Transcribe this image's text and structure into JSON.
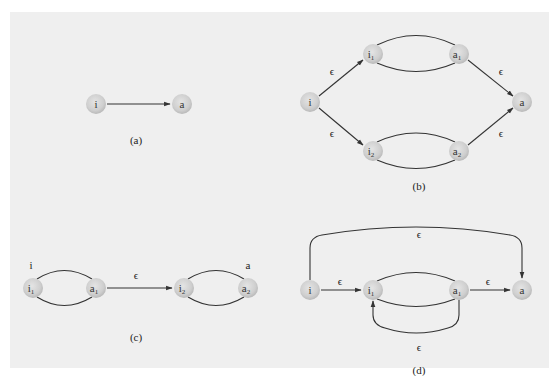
{
  "figure": {
    "background_color": "#efefef",
    "node_fill_color": "#cfcfcf",
    "edge_color": "#333333",
    "epsilon_symbol": "ϵ"
  },
  "panels": {
    "a": {
      "caption": "(a)",
      "nodes": [
        {
          "id": "i",
          "label": "i",
          "sub": ""
        },
        {
          "id": "a",
          "label": "a",
          "sub": ""
        }
      ],
      "edges": [
        {
          "from": "i",
          "to": "a",
          "label": ""
        }
      ]
    },
    "b": {
      "caption": "(b)",
      "nodes": [
        {
          "id": "i",
          "label": "i",
          "sub": ""
        },
        {
          "id": "i1",
          "label": "i",
          "sub": "1"
        },
        {
          "id": "a1",
          "label": "a",
          "sub": "1"
        },
        {
          "id": "i2",
          "label": "i",
          "sub": "2"
        },
        {
          "id": "a2",
          "label": "a",
          "sub": "2"
        },
        {
          "id": "a",
          "label": "a",
          "sub": ""
        }
      ],
      "edges": [
        {
          "from": "i",
          "to": "i1",
          "label": "ϵ"
        },
        {
          "from": "i",
          "to": "i2",
          "label": "ϵ"
        },
        {
          "from": "a1",
          "to": "a",
          "label": "ϵ"
        },
        {
          "from": "a2",
          "to": "a",
          "label": "ϵ"
        }
      ]
    },
    "c": {
      "caption": "(c)",
      "start_label": "i",
      "accept_label": "a",
      "nodes": [
        {
          "id": "i1",
          "label": "i",
          "sub": "1"
        },
        {
          "id": "a1",
          "label": "a",
          "sub": "1"
        },
        {
          "id": "i2",
          "label": "i",
          "sub": "2"
        },
        {
          "id": "a2",
          "label": "a",
          "sub": "2"
        }
      ],
      "edges": [
        {
          "from": "a1",
          "to": "i2",
          "label": "ϵ"
        }
      ]
    },
    "d": {
      "caption": "(d)",
      "nodes": [
        {
          "id": "i",
          "label": "i",
          "sub": ""
        },
        {
          "id": "i1",
          "label": "i",
          "sub": "1"
        },
        {
          "id": "a1",
          "label": "a",
          "sub": "1"
        },
        {
          "id": "a",
          "label": "a",
          "sub": ""
        }
      ],
      "edges": [
        {
          "from": "i",
          "to": "a",
          "label": "ϵ",
          "note": "bypass over top"
        },
        {
          "from": "i",
          "to": "i1",
          "label": "ϵ"
        },
        {
          "from": "a1",
          "to": "a",
          "label": "ϵ"
        },
        {
          "from": "a1",
          "to": "i1",
          "label": "ϵ",
          "note": "loop back underneath"
        }
      ]
    }
  }
}
